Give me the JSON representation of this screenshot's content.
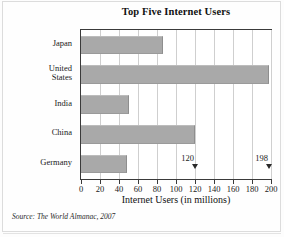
{
  "chart_data": {
    "type": "bar",
    "orientation": "horizontal",
    "title": "Top Five Internet Users",
    "xlabel": "Internet Users (in millions)",
    "ylabel": "Country",
    "categories": [
      "Japan",
      "United States",
      "India",
      "China",
      "Germany"
    ],
    "values": [
      86,
      198,
      50,
      120,
      48
    ],
    "series": [
      {
        "name": "Internet Users (in millions)",
        "values": [
          86,
          198,
          50,
          120,
          48
        ]
      }
    ],
    "xlim": [
      0,
      200
    ],
    "xticks": [
      0,
      20,
      40,
      60,
      80,
      100,
      120,
      140,
      160,
      180,
      200
    ],
    "xtick_labels": [
      "0",
      "20",
      "40",
      "60",
      "80",
      "100",
      "120",
      "140",
      "160",
      "180",
      "200"
    ],
    "grid": "vertical",
    "legend": "none",
    "bar_color": "#a9a9a9",
    "annotations": [
      {
        "label": "120",
        "value": 120
      },
      {
        "label": "198",
        "value": 198
      }
    ],
    "source": "Source: The World Almanac, 2007"
  },
  "category_display": [
    "Japan",
    "United\nStates",
    "India",
    "China",
    "Germany"
  ]
}
